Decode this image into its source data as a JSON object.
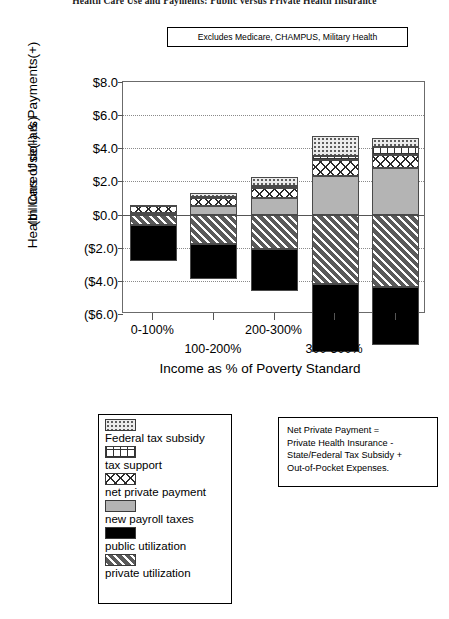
{
  "title": "Health Care Use and Payments: Public versus Private Health Insurance",
  "callout": {
    "excludes_note": "Excludes Medicare, CHAMPUS, Military Health"
  },
  "note_box": {
    "lines": [
      "Net Private Payment =",
      "Private Health Insurance -",
      "State/Federal Tax Subsidy +",
      "Out-of-Pocket Expenses."
    ]
  },
  "legend": {
    "items": [
      {
        "label": "Federal tax subsidy",
        "swatch": "dots-pattern-swatch",
        "color": "#ececec"
      },
      {
        "label": "tax support",
        "swatch": "grid-pattern-swatch",
        "color": "#ffffff"
      },
      {
        "label": "net private payment",
        "swatch": "crosshatch-pattern-swatch",
        "color": "#ffffff"
      },
      {
        "label": "new payroll taxes",
        "swatch": "solid-gray-swatch",
        "color": "#b4b4b4"
      },
      {
        "label": "public utilization",
        "swatch": "solid-black-swatch",
        "color": "#000000"
      },
      {
        "label": "private utilization",
        "swatch": "diagonal-hatch-swatch",
        "color": "#5a5a5a"
      }
    ]
  },
  "chart_data": {
    "type": "bar",
    "subtype": "stacked-diverging",
    "title": "Health Care Use and Payments: Public versus Private Health Insurance",
    "xlabel": "Income as % of Poverty Standard",
    "ylabel": "Health Care Use(-) & Payments(+) (billions of dollars)",
    "ylabel_line1": "Health Care Use(-) & Payments(+)",
    "ylabel_line2": "(billions of dollars)",
    "categories": [
      "0-100%",
      "100-200%",
      "200-300%",
      "300-500%",
      "500%+"
    ],
    "ylim": [
      -6.0,
      8.0
    ],
    "ytick_labels": [
      "$8.0",
      "$6.0",
      "$4.0",
      "$2.0",
      "$0.0",
      "($2.0)",
      "($4.0)",
      "($6.0)"
    ],
    "ytick_values": [
      8.0,
      6.0,
      4.0,
      2.0,
      0.0,
      -2.0,
      -4.0,
      -6.0
    ],
    "grid": true,
    "legend_position": "below-left",
    "series": [
      {
        "name": "public utilization",
        "values": [
          -2.2,
          -2.1,
          -2.5,
          -4.1,
          -3.5
        ]
      },
      {
        "name": "private utilization",
        "values": [
          -0.6,
          -1.8,
          -2.1,
          -4.2,
          -4.4
        ]
      },
      {
        "name": "new payroll taxes",
        "values": [
          0.1,
          0.5,
          1.0,
          2.3,
          2.8
        ]
      },
      {
        "name": "net private payment",
        "values": [
          0.4,
          0.5,
          0.6,
          1.0,
          0.8
        ]
      },
      {
        "name": "tax support",
        "values": [
          0.0,
          0.05,
          0.1,
          0.25,
          0.45
        ]
      },
      {
        "name": "federal tax subsidy",
        "values": [
          0.1,
          0.25,
          0.55,
          1.2,
          0.55
        ]
      }
    ],
    "stack_tops": [
      0.6,
      1.3,
      2.25,
      4.75,
      4.6
    ],
    "stack_bottoms": [
      -2.8,
      -3.9,
      -4.6,
      -8.3,
      -7.9
    ]
  }
}
